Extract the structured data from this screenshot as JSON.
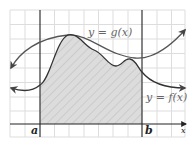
{
  "diagram": {
    "curves": {
      "g": {
        "label": "y = g(x)",
        "color": "#555555"
      },
      "f": {
        "label": "y = f(x)",
        "color": "#333333"
      }
    },
    "axis": {
      "x_label": "x",
      "color": "#222222"
    },
    "bounds": {
      "a_label": "a",
      "b_label": "b"
    },
    "shaded_region": {
      "fill": "#dcdcdc",
      "hatch": "#c8c8c8"
    },
    "grid": {
      "color": "#dddddd",
      "cell_size": 14.6
    },
    "label_color": "#666666"
  }
}
